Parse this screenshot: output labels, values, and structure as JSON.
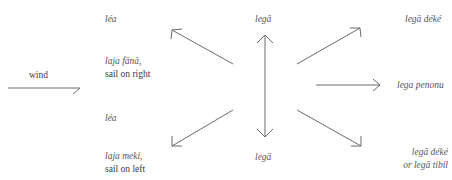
{
  "diagram": {
    "type": "sailing-directions-relative-to-wind",
    "wind": {
      "label": "wind"
    },
    "left_column": {
      "upper": {
        "term": "léa",
        "sub_term": "laja fānā,",
        "gloss": "sail on right"
      },
      "lower": {
        "term": "léa",
        "sub_term": "laja meki,",
        "gloss": "sail on left"
      }
    },
    "center": {
      "top_label": "legā",
      "bottom_label": "legā"
    },
    "right_column": {
      "top": "legā déké",
      "middle": "lega penonu",
      "bottom_line1": "legā déké",
      "bottom_line2": "or legā tibil"
    },
    "arrows": [
      {
        "name": "wind-arrow",
        "direction": "east"
      },
      {
        "name": "arrow-northwest",
        "direction": "northwest"
      },
      {
        "name": "arrow-southwest",
        "direction": "southwest"
      },
      {
        "name": "arrow-vertical",
        "direction": "north-south"
      },
      {
        "name": "arrow-northeast",
        "direction": "northeast"
      },
      {
        "name": "arrow-east",
        "direction": "east"
      },
      {
        "name": "arrow-southeast",
        "direction": "southeast"
      }
    ],
    "colors": {
      "line": "#6a6a6a",
      "text": "#555555",
      "background": "#ffffff"
    }
  }
}
